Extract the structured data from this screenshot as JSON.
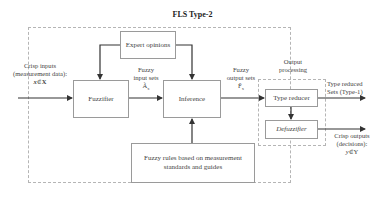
{
  "diagram": {
    "title": "FLS Type-2",
    "blocks": {
      "expert_opinions": "Expert opinions",
      "fuzzifier": "Fuzzifier",
      "inference": "Inference",
      "type_reducer": "Type reducer",
      "defuzzifier": "Defuzzifier",
      "fuzzy_rules_line1": "Fuzzy rules based on measurement",
      "fuzzy_rules_line2": "standards and guides"
    },
    "groups": {
      "output_processing_line1": "Output",
      "output_processing_line2": "processing"
    },
    "edges": {
      "crisp_inputs_line1": "Crisp inputs",
      "crisp_inputs_line2": "(measurement data):",
      "crisp_inputs_var": "x",
      "crisp_inputs_set": "X",
      "fuzzy_input_line1": "Fuzzy",
      "fuzzy_input_line2": "input sets",
      "fuzzy_input_sym": "Ã",
      "fuzzy_input_sub": "x",
      "fuzzy_output_line1": "Fuzzy",
      "fuzzy_output_line2": "output sets",
      "fuzzy_output_sym": "F̃",
      "fuzzy_output_sub": "x",
      "type_reduced_line1": "Type reduced",
      "type_reduced_line2": "Sets (Type-1)",
      "crisp_outputs_line1": "Crisp outputs",
      "crisp_outputs_line2": "(decisions):",
      "crisp_outputs_var": "y",
      "crisp_outputs_set": "Y",
      "element_of": "∈"
    },
    "colors": {
      "line": "#333333",
      "box_border": "#9a9a9a",
      "dashed_border": "#b5b5b5"
    }
  }
}
